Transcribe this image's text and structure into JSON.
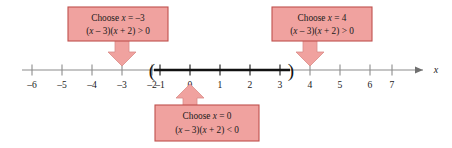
{
  "figure": {
    "background": "#ffffff"
  },
  "colors": {
    "callout_fill": "#f0a29f",
    "callout_border": "#c0504d",
    "axis_line": "#8c8c8c",
    "axis_bold": "#111111",
    "text": "#1a1a1a"
  },
  "number_line": {
    "variable_label": "x",
    "tick_values": [
      -6,
      -5,
      -4,
      -3,
      -2,
      -1,
      0,
      1,
      2,
      3,
      4,
      5,
      6,
      7
    ],
    "tick_labels": [
      "–6",
      "–5",
      "–4",
      "–3",
      "–2",
      "–1",
      "0",
      "1",
      "2",
      "3",
      "4",
      "5",
      "6",
      "7"
    ],
    "origin_x_px": 190,
    "unit_px": 30,
    "axis_y_px": 70,
    "arrow_end_value": 7.9,
    "highlight": {
      "from_value": -2,
      "to_value": 3,
      "left_endpoint_symbol": "(",
      "right_endpoint_symbol": ")",
      "endpoints_open": true,
      "description": "Open interval from -2 to 3 drawn in bold"
    }
  },
  "callouts": [
    {
      "id": "left",
      "line1": "Choose x = –3",
      "line1_parts": {
        "lead": "Choose ",
        "var": "x",
        "rest": " = –3"
      },
      "line2": "(x – 3)(x + 2) > 0",
      "target_value": -3,
      "arrow_direction": "down",
      "box": {
        "x": 68,
        "y": 7,
        "width": 100,
        "height": 34
      }
    },
    {
      "id": "right",
      "line1": "Choose x = 4",
      "line1_parts": {
        "lead": "Choose ",
        "var": "x",
        "rest": " = 4"
      },
      "line2": "(x – 3)(x + 2) > 0",
      "target_value": 4,
      "arrow_direction": "down",
      "box": {
        "x": 272,
        "y": 7,
        "width": 100,
        "height": 34
      }
    },
    {
      "id": "bottom",
      "line1": "Choose x = 0",
      "line1_parts": {
        "lead": "Choose ",
        "var": "x",
        "rest": " = 0"
      },
      "line2": "(x – 3)(x + 2) < 0",
      "target_value": 0,
      "arrow_direction": "up",
      "box": {
        "x": 155,
        "y": 105,
        "width": 104,
        "height": 36
      }
    }
  ]
}
